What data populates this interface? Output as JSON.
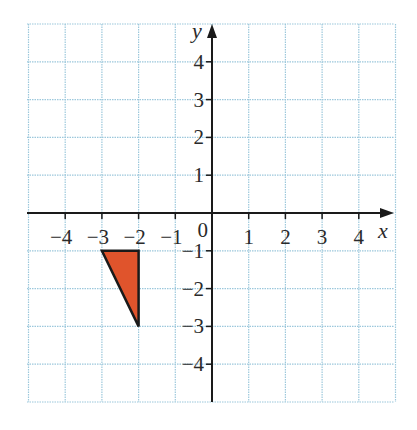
{
  "chart_data": {
    "type": "coordinate-grid",
    "title": "",
    "xlabel": "x",
    "ylabel": "y",
    "origin_label": "0",
    "xlim": [
      -5,
      5
    ],
    "ylim": [
      -5,
      5
    ],
    "grid": true,
    "x_ticks": [
      -4,
      -3,
      -2,
      -1,
      1,
      2,
      3,
      4
    ],
    "y_ticks": [
      4,
      3,
      2,
      1,
      -1,
      -2,
      -3,
      -4
    ],
    "x_tick_labels": [
      "−4",
      "−3",
      "−2",
      "−1",
      "1",
      "2",
      "3",
      "4"
    ],
    "y_tick_labels": [
      "4",
      "3",
      "2",
      "1",
      "−1",
      "−2",
      "−3",
      "−4"
    ],
    "shapes": [
      {
        "type": "polygon",
        "name": "triangle",
        "vertices": [
          [
            -3,
            -1
          ],
          [
            -2,
            -1
          ],
          [
            -2,
            -3
          ]
        ],
        "fill": "#e0542c",
        "stroke": "#1a1a1a"
      }
    ]
  },
  "colors": {
    "grid": "#9cc8dc",
    "axis": "#1a1a1a",
    "shape_fill": "#e0542c"
  }
}
